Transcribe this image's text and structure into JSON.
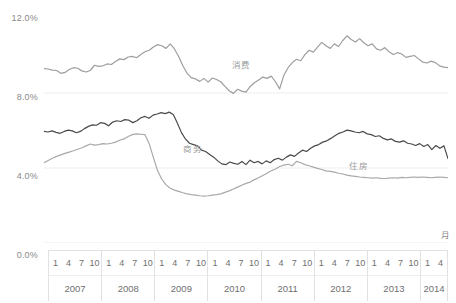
{
  "chart_data": {
    "type": "line",
    "title": "",
    "xlabel": "月",
    "ylabel": "",
    "ylim": [
      0,
      12
    ],
    "yticks": [
      "0.0%",
      "4.0%",
      "8.0%",
      "12.0%"
    ],
    "ytick_values": [
      0,
      4,
      8,
      12
    ],
    "grid": true,
    "legend": "inline-labels",
    "x_month_ticks": [
      "1",
      "4",
      "7",
      "10"
    ],
    "x_year_groups": [
      {
        "year": "2007",
        "months": [
          "1",
          "4",
          "7",
          "10"
        ]
      },
      {
        "year": "2008",
        "months": [
          "1",
          "4",
          "7",
          "10"
        ]
      },
      {
        "year": "2009",
        "months": [
          "1",
          "4",
          "7",
          "10"
        ]
      },
      {
        "year": "2010",
        "months": [
          "1",
          "4",
          "7",
          "10"
        ]
      },
      {
        "year": "2011",
        "months": [
          "1",
          "4",
          "7",
          "10"
        ]
      },
      {
        "year": "2012",
        "months": [
          "1",
          "4",
          "7",
          "10"
        ]
      },
      {
        "year": "2013",
        "months": [
          "1",
          "4",
          "7",
          "10"
        ]
      },
      {
        "year": "2014",
        "months": [
          "1",
          "4"
        ]
      }
    ],
    "x_start": "2007-01",
    "x_end": "2014-05",
    "series": [
      {
        "name": "消费",
        "color": "#9e9e9e",
        "label_x": 0.465,
        "label_y": 9.55,
        "values": [
          9.3,
          9.28,
          9.22,
          9.2,
          9.05,
          9.1,
          9.25,
          9.35,
          9.32,
          9.18,
          9.12,
          9.2,
          9.48,
          9.42,
          9.45,
          9.55,
          9.52,
          9.68,
          9.82,
          9.78,
          9.92,
          9.95,
          9.88,
          10.05,
          10.2,
          10.28,
          10.45,
          10.58,
          10.52,
          10.38,
          10.62,
          10.35,
          9.95,
          9.45,
          9.05,
          8.82,
          8.75,
          8.62,
          8.78,
          8.58,
          8.8,
          8.72,
          8.6,
          8.35,
          8.12,
          7.98,
          8.2,
          8.1,
          8.05,
          8.35,
          8.55,
          8.7,
          8.85,
          8.78,
          8.9,
          8.6,
          8.22,
          8.95,
          9.35,
          9.62,
          9.8,
          9.72,
          10.05,
          10.28,
          10.18,
          10.45,
          10.7,
          10.52,
          10.38,
          10.62,
          10.48,
          10.8,
          11.05,
          10.85,
          10.72,
          10.9,
          10.68,
          10.52,
          10.62,
          10.35,
          10.28,
          10.42,
          10.2,
          10.05,
          10.15,
          10.08,
          9.9,
          9.95,
          10.0,
          9.82,
          9.65,
          9.6,
          9.7,
          9.62,
          9.45,
          9.38,
          9.35
        ]
      },
      {
        "name": "商务",
        "color": "#4a4a4a",
        "label_x": 0.345,
        "label_y": 5.05,
        "values": [
          5.95,
          5.92,
          5.98,
          5.9,
          5.85,
          5.95,
          6.02,
          5.98,
          5.88,
          5.95,
          6.1,
          6.22,
          6.3,
          6.28,
          6.42,
          6.38,
          6.25,
          6.45,
          6.52,
          6.48,
          6.58,
          6.55,
          6.42,
          6.52,
          6.68,
          6.75,
          6.65,
          6.82,
          6.88,
          6.95,
          6.9,
          6.98,
          6.85,
          6.4,
          5.9,
          5.55,
          5.32,
          5.25,
          5.18,
          4.95,
          4.88,
          4.72,
          4.58,
          4.38,
          4.22,
          4.18,
          4.32,
          4.25,
          4.2,
          4.35,
          4.18,
          4.42,
          4.28,
          4.35,
          4.22,
          4.38,
          4.28,
          4.45,
          4.52,
          4.42,
          4.58,
          4.7,
          4.62,
          4.8,
          4.95,
          4.88,
          5.05,
          5.18,
          5.25,
          5.38,
          5.45,
          5.58,
          5.72,
          5.85,
          5.92,
          6.02,
          5.98,
          5.92,
          5.88,
          5.95,
          5.82,
          5.78,
          5.68,
          5.72,
          5.58,
          5.5,
          5.55,
          5.42,
          5.38,
          5.45,
          5.32,
          5.28,
          5.2,
          5.3,
          5.15,
          5.25,
          4.98,
          5.2,
          5.05,
          5.18,
          4.5
        ]
      },
      {
        "name": "住房",
        "color": "#a8a8a8",
        "label_x": 0.755,
        "label_y": 4.15,
        "values": [
          4.28,
          4.4,
          4.52,
          4.62,
          4.7,
          4.78,
          4.85,
          4.92,
          5.0,
          5.08,
          5.18,
          5.28,
          5.22,
          5.25,
          5.3,
          5.28,
          5.32,
          5.38,
          5.48,
          5.55,
          5.68,
          5.78,
          5.82,
          5.8,
          5.78,
          5.3,
          4.55,
          3.85,
          3.4,
          3.1,
          2.92,
          2.82,
          2.75,
          2.68,
          2.62,
          2.58,
          2.55,
          2.52,
          2.5,
          2.52,
          2.55,
          2.58,
          2.62,
          2.7,
          2.78,
          2.88,
          2.98,
          3.08,
          3.18,
          3.25,
          3.38,
          3.48,
          3.6,
          3.72,
          3.85,
          3.95,
          4.08,
          4.15,
          4.2,
          4.12,
          4.35,
          4.28,
          4.18,
          4.12,
          4.05,
          3.98,
          3.92,
          3.85,
          3.82,
          3.78,
          3.72,
          3.68,
          3.62,
          3.58,
          3.55,
          3.52,
          3.5,
          3.48,
          3.46,
          3.48,
          3.45,
          3.44,
          3.46,
          3.48,
          3.46,
          3.5,
          3.48,
          3.5,
          3.52,
          3.5,
          3.52,
          3.5,
          3.48,
          3.5,
          3.52,
          3.5,
          3.48
        ]
      }
    ]
  }
}
